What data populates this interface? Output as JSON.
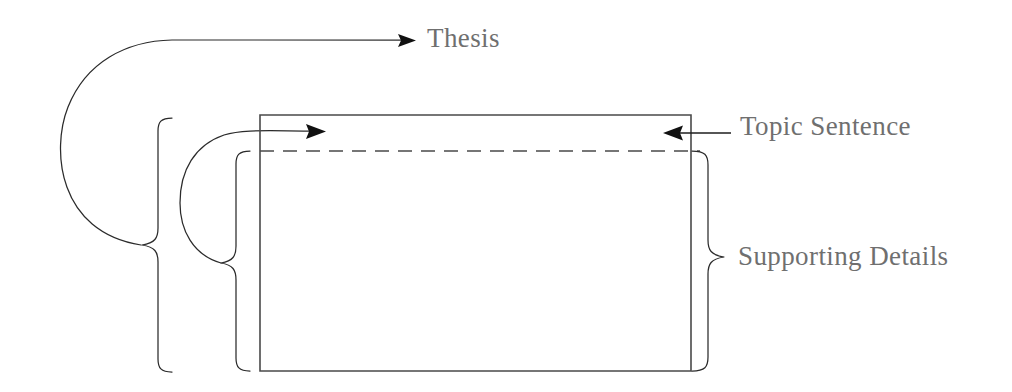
{
  "diagram": {
    "background_color": "#ffffff",
    "line_color": "#2b2b2b",
    "text_color": "#6f6f6f",
    "labels": {
      "thesis": "Thesis",
      "topic_sentence": "Topic Sentence",
      "supporting_details": "Supporting Details"
    },
    "elements": {
      "paragraph_box": "paragraph-rectangle",
      "dashed_divider": "dashed-divider-line",
      "outer_brace": "outer-left-brace",
      "inner_brace": "inner-left-brace",
      "right_brace": "right-brace",
      "thesis_connector": "thesis-curve-connector",
      "topic_connector": "topic-sentence-curve-connector"
    }
  }
}
